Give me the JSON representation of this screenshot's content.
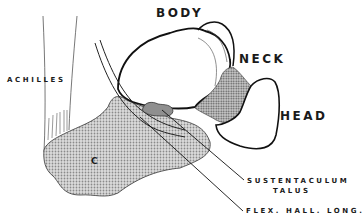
{
  "diagram": {
    "colors": {
      "outline": "#1a1a1a",
      "background": "#ffffff",
      "calcaneus_fill": "#c9c9c9",
      "neck_fill": "#a8a8a8",
      "sustentaculum_fill": "#8f8f8f"
    },
    "labels": {
      "body": "BODY",
      "neck": "NECK",
      "head": "HEAD",
      "achilles": "ACHILLES",
      "calcaneus": "C",
      "sustentaculum_line1": "SUSTENTACULUM",
      "sustentaculum_line2": "TALUS",
      "flexor": "FLEX. HALL. LONG."
    }
  }
}
